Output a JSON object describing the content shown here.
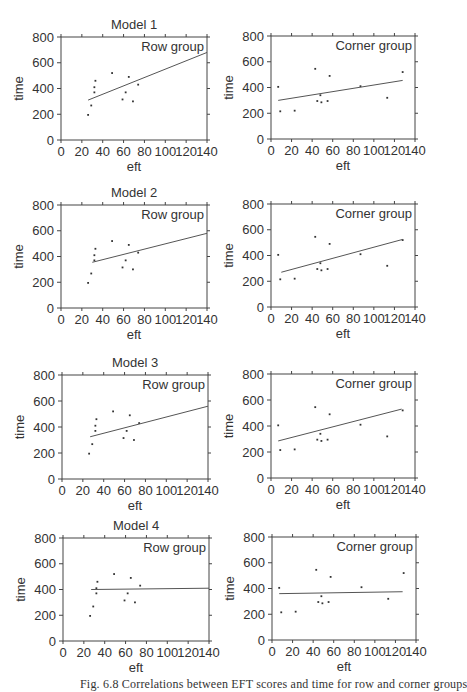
{
  "figure": {
    "caption": "Fig. 6.8   Correlations between EFT scores and time for row and corner groups"
  },
  "axes": {
    "xlabel": "eft",
    "ylabel": "time",
    "xlim": [
      0,
      140
    ],
    "ylim": [
      0,
      800
    ],
    "xticks": [
      0,
      20,
      40,
      60,
      80,
      100,
      120,
      140
    ],
    "yticks": [
      0,
      200,
      400,
      600,
      800
    ]
  },
  "colors": {
    "axis": "#444444",
    "line": "#555555",
    "point": "#333333",
    "text": "#333333"
  },
  "chart_data": [
    {
      "type": "scatter",
      "title": "Model 1",
      "panel_label": "Row group",
      "xlabel": "eft",
      "ylabel": "time",
      "xlim": [
        0,
        140
      ],
      "ylim": [
        0,
        800
      ],
      "points": [
        [
          26,
          195
        ],
        [
          29,
          268
        ],
        [
          32,
          410
        ],
        [
          32,
          370
        ],
        [
          33,
          460
        ],
        [
          49,
          520
        ],
        [
          59,
          315
        ],
        [
          62,
          370
        ],
        [
          65,
          490
        ],
        [
          69,
          300
        ],
        [
          74,
          430
        ]
      ],
      "fit_line": [
        [
          26,
          310
        ],
        [
          140,
          680
        ]
      ]
    },
    {
      "type": "scatter",
      "title": "",
      "panel_label": "Corner group",
      "xlabel": "eft",
      "ylabel": "time",
      "xlim": [
        0,
        140
      ],
      "ylim": [
        0,
        800
      ],
      "points": [
        [
          7,
          405
        ],
        [
          9,
          215
        ],
        [
          23,
          220
        ],
        [
          43,
          545
        ],
        [
          45,
          295
        ],
        [
          48,
          340
        ],
        [
          49,
          285
        ],
        [
          55,
          295
        ],
        [
          57,
          490
        ],
        [
          87,
          410
        ],
        [
          113,
          320
        ],
        [
          128,
          520
        ]
      ],
      "fit_line": [
        [
          7,
          300
        ],
        [
          128,
          455
        ]
      ]
    },
    {
      "type": "scatter",
      "title": "Model 2",
      "panel_label": "Row group",
      "xlabel": "eft",
      "ylabel": "time",
      "xlim": [
        0,
        140
      ],
      "ylim": [
        0,
        800
      ],
      "points": [
        [
          26,
          195
        ],
        [
          29,
          268
        ],
        [
          32,
          410
        ],
        [
          32,
          370
        ],
        [
          33,
          460
        ],
        [
          49,
          520
        ],
        [
          59,
          315
        ],
        [
          62,
          370
        ],
        [
          65,
          490
        ],
        [
          69,
          300
        ],
        [
          74,
          430
        ]
      ],
      "fit_line": [
        [
          30,
          355
        ],
        [
          140,
          580
        ]
      ]
    },
    {
      "type": "scatter",
      "title": "",
      "panel_label": "Corner group",
      "xlabel": "eft",
      "ylabel": "time",
      "xlim": [
        0,
        140
      ],
      "ylim": [
        0,
        800
      ],
      "points": [
        [
          7,
          405
        ],
        [
          9,
          215
        ],
        [
          23,
          220
        ],
        [
          43,
          545
        ],
        [
          45,
          295
        ],
        [
          48,
          340
        ],
        [
          49,
          285
        ],
        [
          55,
          295
        ],
        [
          57,
          490
        ],
        [
          87,
          410
        ],
        [
          113,
          320
        ],
        [
          128,
          520
        ]
      ],
      "fit_line": [
        [
          10,
          270
        ],
        [
          128,
          525
        ]
      ]
    },
    {
      "type": "scatter",
      "title": "Model 3",
      "panel_label": "Row group",
      "xlabel": "eft",
      "ylabel": "time",
      "xlim": [
        0,
        140
      ],
      "ylim": [
        0,
        800
      ],
      "points": [
        [
          26,
          195
        ],
        [
          29,
          268
        ],
        [
          32,
          410
        ],
        [
          32,
          370
        ],
        [
          33,
          460
        ],
        [
          49,
          520
        ],
        [
          59,
          315
        ],
        [
          62,
          370
        ],
        [
          65,
          490
        ],
        [
          69,
          300
        ],
        [
          74,
          430
        ]
      ],
      "fit_line": [
        [
          27,
          325
        ],
        [
          140,
          560
        ]
      ]
    },
    {
      "type": "scatter",
      "title": "",
      "panel_label": "Corner group",
      "xlabel": "eft",
      "ylabel": "time",
      "xlim": [
        0,
        140
      ],
      "ylim": [
        0,
        800
      ],
      "points": [
        [
          7,
          405
        ],
        [
          9,
          215
        ],
        [
          23,
          220
        ],
        [
          43,
          545
        ],
        [
          45,
          295
        ],
        [
          48,
          340
        ],
        [
          49,
          285
        ],
        [
          55,
          295
        ],
        [
          57,
          490
        ],
        [
          87,
          410
        ],
        [
          113,
          320
        ],
        [
          128,
          520
        ]
      ],
      "fit_line": [
        [
          7,
          285
        ],
        [
          127,
          530
        ]
      ]
    },
    {
      "type": "scatter",
      "title": "Model 4",
      "panel_label": "Row group",
      "xlabel": "eft",
      "ylabel": "time",
      "xlim": [
        0,
        140
      ],
      "ylim": [
        0,
        800
      ],
      "points": [
        [
          26,
          195
        ],
        [
          29,
          268
        ],
        [
          32,
          410
        ],
        [
          32,
          370
        ],
        [
          33,
          460
        ],
        [
          49,
          520
        ],
        [
          59,
          315
        ],
        [
          62,
          370
        ],
        [
          65,
          490
        ],
        [
          69,
          300
        ],
        [
          74,
          430
        ]
      ],
      "fit_line": [
        [
          27,
          400
        ],
        [
          140,
          410
        ]
      ]
    },
    {
      "type": "scatter",
      "title": "",
      "panel_label": "Corner group",
      "xlabel": "eft",
      "ylabel": "time",
      "xlim": [
        0,
        140
      ],
      "ylim": [
        0,
        800
      ],
      "points": [
        [
          7,
          405
        ],
        [
          9,
          215
        ],
        [
          23,
          220
        ],
        [
          43,
          545
        ],
        [
          45,
          295
        ],
        [
          48,
          340
        ],
        [
          49,
          285
        ],
        [
          55,
          295
        ],
        [
          57,
          490
        ],
        [
          87,
          410
        ],
        [
          113,
          320
        ],
        [
          128,
          520
        ]
      ],
      "fit_line": [
        [
          7,
          360
        ],
        [
          127,
          375
        ]
      ]
    }
  ],
  "layout": {
    "panels": [
      {
        "left": 61,
        "top": 37,
        "width": 146,
        "height": 103
      },
      {
        "left": 271,
        "top": 36,
        "width": 144,
        "height": 103
      },
      {
        "left": 61,
        "top": 205,
        "width": 146,
        "height": 103
      },
      {
        "left": 271,
        "top": 204,
        "width": 144,
        "height": 103
      },
      {
        "left": 62,
        "top": 375,
        "width": 146,
        "height": 104
      },
      {
        "left": 271,
        "top": 374,
        "width": 144,
        "height": 104
      },
      {
        "left": 63,
        "top": 538,
        "width": 146,
        "height": 103
      },
      {
        "left": 272,
        "top": 537,
        "width": 144,
        "height": 103
      }
    ]
  }
}
